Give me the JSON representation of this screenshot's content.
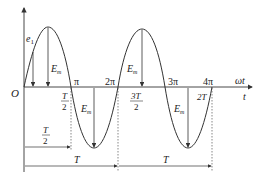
{
  "diagram": {
    "type": "sinusoidal-emf-waveform",
    "axis_labels": {
      "origin": "O",
      "vertical": "e",
      "vertical_subscript": "1",
      "horizontal_upper": "ωt",
      "horizontal_lower": "t"
    },
    "angle_ticks": [
      "π",
      "2π",
      "3π",
      "4π"
    ],
    "time_ticks": {
      "half_T_num": "T",
      "half_T_den": "2",
      "three_half_T_num": "3T",
      "three_half_T_den": "2",
      "two_T": "2T"
    },
    "amplitude_label": "E",
    "amplitude_subscript": "m",
    "dimensions": {
      "half_period_num": "T",
      "half_period_den": "2",
      "period_1": "T",
      "period_2": "T"
    },
    "colors": {
      "stroke": "#333333",
      "text": "#222222"
    }
  }
}
